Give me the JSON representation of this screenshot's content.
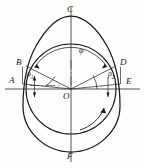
{
  "figure": {
    "kind": "cam-profile-geometry-diagram",
    "background_color": "#fdfdfb",
    "stroke_color": "#1a1a1a",
    "labels": {
      "top_vertex": "C",
      "bottom_vertex": "F",
      "left_outer": "A",
      "left_inner": "B",
      "right_inner": "D",
      "right_outer": "E",
      "center": "O",
      "angle_phi": "φ",
      "angle_rho1_base": "ρ",
      "angle_rho1_sub": "1",
      "angle_rho2_base": "ρ",
      "angle_rho2_sub": "2"
    },
    "geometry": {
      "center_x": 71,
      "center_y": 89,
      "base_circle_radius": 45,
      "outer_curve_top_y": 16,
      "outer_curve_bottom_y": 152,
      "horizontal_axis_y": 89,
      "vertical_axis_x": 71,
      "axis_left_x": 6,
      "axis_right_x": 139,
      "axis_top_y": 7,
      "axis_bottom_y": 161
    }
  }
}
